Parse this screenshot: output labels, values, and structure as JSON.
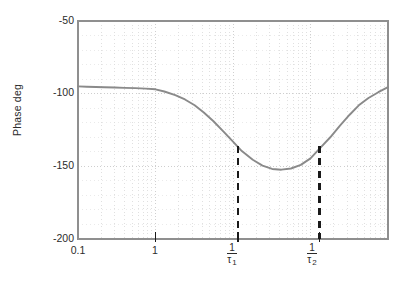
{
  "chart_data": {
    "type": "line",
    "title": "",
    "xlabel": "",
    "ylabel": "Phase deg",
    "xscale": "log",
    "xlim": [
      0.1,
      1000
    ],
    "ylim": [
      -200,
      -50
    ],
    "grid": true,
    "grid_style": "dotted-log-minor",
    "legend": false,
    "y_ticks": [
      -50,
      -100,
      -150,
      -200
    ],
    "y_tick_labels": [
      "-50",
      "-100",
      "-150",
      "-200"
    ],
    "x_ticks": [
      0.1,
      1,
      11.5,
      130
    ],
    "x_tick_labels": [
      "0.1",
      "1",
      "1/τ₁",
      "1/τ₂"
    ],
    "series": [
      {
        "name": "phase",
        "color": "#8a8a8a",
        "x": [
          0.1,
          0.13,
          0.17,
          0.22,
          0.3,
          0.4,
          0.55,
          0.75,
          1.0,
          1.3,
          1.8,
          2.4,
          3.2,
          4.2,
          5.6,
          7.5,
          10.0,
          13.0,
          18.0,
          24.0,
          32.0,
          42.0,
          56.0,
          75.0,
          100.0,
          130.0,
          180.0,
          240.0,
          320.0,
          420.0,
          560.0,
          750.0,
          1000.0
        ],
        "y": [
          -95.0,
          -95.2,
          -95.4,
          -95.6,
          -95.8,
          -96.0,
          -96.2,
          -96.5,
          -97.0,
          -98.5,
          -101.0,
          -104.0,
          -108.0,
          -113.0,
          -119.0,
          -126.0,
          -133.0,
          -139.5,
          -145.5,
          -149.5,
          -151.8,
          -152.3,
          -151.5,
          -149.0,
          -144.5,
          -138.0,
          -130.0,
          -122.0,
          -114.5,
          -108.0,
          -103.0,
          -99.0,
          -95.5
        ]
      }
    ],
    "annotations": [
      {
        "type": "vline",
        "name": "tau1-marker",
        "x": 11.5,
        "y_from": -200,
        "y_to": -136,
        "style": "dashed",
        "color": "#1a1a1a"
      },
      {
        "type": "vline",
        "name": "tau2-marker",
        "x": 130,
        "y_from": -200,
        "y_to": -136,
        "style": "dashed",
        "color": "#1a1a1a"
      }
    ]
  },
  "axis": {
    "ylabel": "Phase deg",
    "yticks": [
      {
        "label": "-50",
        "value": -50
      },
      {
        "label": "-100",
        "value": -100
      },
      {
        "label": "-150",
        "value": -150
      },
      {
        "label": "-200",
        "value": -200
      }
    ],
    "xticks": [
      {
        "label": "0.1",
        "kind": "plain"
      },
      {
        "label": "1",
        "kind": "plain"
      },
      {
        "numerator": "1",
        "denominator": "τ",
        "subscript": "1",
        "kind": "fraction"
      },
      {
        "numerator": "1",
        "denominator": "τ",
        "subscript": "2",
        "kind": "fraction"
      }
    ]
  },
  "colors": {
    "curve": "#8a8a8a",
    "frame": "#8f8f8f",
    "grid": "#c9c9c9",
    "marker": "#1a1a1a",
    "text": "#2b2b2b"
  }
}
